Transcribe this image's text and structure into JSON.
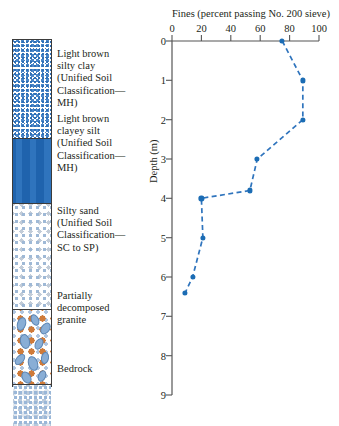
{
  "figure": {
    "accent_color": "#1b6cb4",
    "line_color": "#2f74bd"
  },
  "soil_profile": {
    "name": "soil-boring-log",
    "layers": [
      {
        "id": "silty-clay",
        "pattern": "dense-blue-stipple",
        "top_depth_m": 0,
        "bottom_depth_m": 2.35,
        "label": "Light brown silty clay (Unified Soil Classification—MH)",
        "label_lines": [
          "Light brown",
          "silty clay",
          "(Unified Soil",
          "Classification—",
          "MH)"
        ]
      },
      {
        "id": "clayey-silt",
        "pattern": "horizontal-wavy-dashes",
        "top_depth_m": 2.35,
        "bottom_depth_m": 3.9,
        "label": "Light brown clayey silt (Unified Soil Classification—MH)",
        "label_lines": [
          "Light brown",
          "clayey silt",
          "(Unified Soil",
          "Classification—",
          "MH)"
        ]
      },
      {
        "id": "silty-sand",
        "pattern": "fine-light-speckle",
        "top_depth_m": 3.9,
        "bottom_depth_m": 6.45,
        "label": "Silty sand (Unified Soil Classification—SC to SP)",
        "label_lines": [
          "Silty sand",
          "(Unified Soil",
          "Classification—",
          "SC to SP)"
        ]
      },
      {
        "id": "decomposed-granite",
        "pattern": "blue-ellipses",
        "top_depth_m": 6.45,
        "bottom_depth_m": 8.25,
        "label": "Partially decomposed granite",
        "label_lines": [
          "Partially",
          "decomposed",
          "granite"
        ]
      },
      {
        "id": "bedrock",
        "pattern": "irregular-speckle",
        "top_depth_m": 8.25,
        "bottom_depth_m": 9.0,
        "label": "Bedrock",
        "label_lines": [
          "Bedrock"
        ]
      }
    ]
  },
  "chart_data": {
    "type": "line",
    "title": "Fines (percent passing No. 200 sieve)",
    "xlabel": "Fines (percent passing No. 200 sieve)",
    "ylabel": "Depth (m)",
    "xlim": [
      0,
      100
    ],
    "ylim": [
      0,
      9
    ],
    "y_inverted": true,
    "grid": false,
    "legend": "none",
    "line_style": "dashed",
    "marker": "filled-circle",
    "xticks": [
      0,
      20,
      40,
      60,
      80,
      100
    ],
    "xticklabels": [
      "0",
      "20",
      "40",
      "60",
      "80",
      "100"
    ],
    "yticks": [
      0,
      1,
      2,
      3,
      4,
      5,
      6,
      7,
      8,
      9
    ],
    "yticklabels": [
      "0",
      "1",
      "2",
      "3",
      "4",
      "5",
      "6",
      "7",
      "8",
      "9"
    ],
    "series": [
      {
        "name": "Percent fines vs depth",
        "x": [
          75,
          89,
          89,
          58,
          53,
          20,
          21,
          14,
          9
        ],
        "y": [
          0,
          1,
          2,
          3,
          3.8,
          4,
          5,
          6,
          6.4
        ]
      }
    ]
  }
}
